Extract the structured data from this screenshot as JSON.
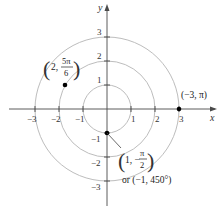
{
  "diagram": {
    "type": "polar-coordinates-plot",
    "axes": {
      "x_label": "x",
      "y_label": "y",
      "x_ticks": [
        "−3",
        "−2",
        "−1",
        "1",
        "2",
        "3"
      ],
      "y_ticks": [
        "3",
        "2",
        "1",
        "−1",
        "−2",
        "−3"
      ]
    },
    "circles": [
      {
        "radius": 1
      },
      {
        "radius": 2
      },
      {
        "radius": 3
      }
    ],
    "points": [
      {
        "id": "p1",
        "label_r": "2,",
        "label_num": "5π",
        "label_den": "6",
        "polar": "(2, 5π/6)"
      },
      {
        "id": "p2",
        "label": "(−3, π)",
        "polar": "(−3, π)"
      },
      {
        "id": "p3",
        "label_r": "1, −",
        "label_num": "π",
        "label_den": "2",
        "polar": "(1, −π/2)",
        "alt_label": "or (−1, 450°)"
      }
    ],
    "colors": {
      "circle": "#bdbdbd",
      "axis": "#4a4a4a",
      "point": "#000000"
    }
  }
}
